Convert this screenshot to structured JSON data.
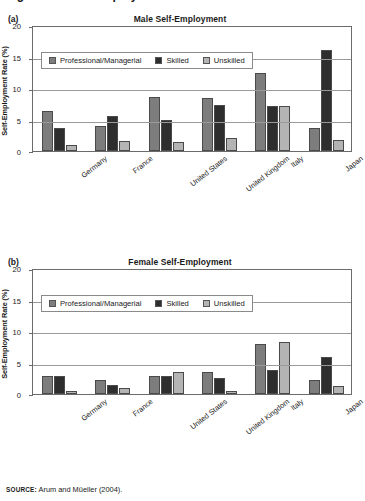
{
  "figure": {
    "caption": "Figure 3.5  Self-Employment Across Countries",
    "source_label": "SOURCE:",
    "source_text": " Arum and Müeller (2004)."
  },
  "colors": {
    "professional": "#7d7d7d",
    "skilled": "#2e2e2e",
    "unskilled": "#b4b4b4",
    "axis": "#6b6b6b",
    "grid": "#9a9a9a"
  },
  "legend": {
    "items": [
      {
        "label": "Professional/Managerial",
        "color": "#7d7d7d"
      },
      {
        "label": "Skilled",
        "color": "#2e2e2e"
      },
      {
        "label": "Unskilled",
        "color": "#b4b4b4"
      }
    ]
  },
  "panels": [
    {
      "letter": "(a)",
      "title": "Male Self-Employment"
    },
    {
      "letter": "(b)",
      "title": "Female Self-Employment"
    }
  ],
  "chart_data": [
    {
      "type": "bar",
      "title": "Male Self-Employment",
      "panel": "(a)",
      "xlabel": "",
      "ylabel": "Self-Employment Rate (%)",
      "ylim": [
        0,
        20
      ],
      "yticks": [
        0,
        5,
        10,
        15,
        20
      ],
      "grid": true,
      "legend_position": "top-left-inside",
      "categories": [
        "Germany",
        "France",
        "United States",
        "United Kingdom",
        "Italy",
        "Japan"
      ],
      "series": [
        {
          "name": "Professional/Managerial",
          "color": "#7d7d7d",
          "values": [
            6.3,
            4.0,
            8.6,
            8.4,
            12.4,
            3.6
          ]
        },
        {
          "name": "Skilled",
          "color": "#2e2e2e",
          "values": [
            3.7,
            5.5,
            5.0,
            7.3,
            7.2,
            16.0
          ]
        },
        {
          "name": "Unskilled",
          "color": "#b4b4b4",
          "values": [
            0.9,
            1.6,
            1.4,
            2.1,
            7.2,
            1.8
          ]
        }
      ]
    },
    {
      "type": "bar",
      "title": "Female Self-Employment",
      "panel": "(b)",
      "xlabel": "",
      "ylabel": "Self-Employment Rate (%)",
      "ylim": [
        0,
        20
      ],
      "yticks": [
        0,
        5,
        10,
        15,
        20
      ],
      "grid": true,
      "legend_position": "top-left-inside",
      "categories": [
        "Germany",
        "France",
        "United States",
        "United Kingdom",
        "Italy",
        "Japan"
      ],
      "series": [
        {
          "name": "Professional/Managerial",
          "color": "#7d7d7d",
          "values": [
            2.9,
            2.2,
            2.9,
            3.5,
            7.9,
            2.3
          ]
        },
        {
          "name": "Skilled",
          "color": "#2e2e2e",
          "values": [
            2.9,
            1.5,
            2.8,
            2.6,
            3.8,
            5.8
          ]
        },
        {
          "name": "Unskilled",
          "color": "#b4b4b4",
          "values": [
            0.5,
            0.9,
            3.5,
            0.4,
            8.2,
            1.3
          ]
        }
      ]
    }
  ]
}
